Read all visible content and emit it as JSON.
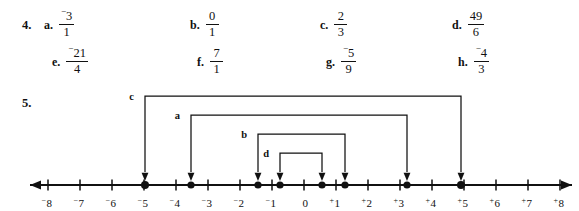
{
  "exercise4": {
    "number": "4.",
    "items": [
      {
        "letter": "a.",
        "numerator": "3",
        "numerator_sign": "−",
        "denominator": "1",
        "x": 44,
        "y": 10
      },
      {
        "letter": "b.",
        "numerator": "0",
        "numerator_sign": "",
        "denominator": "1",
        "x": 190,
        "y": 10
      },
      {
        "letter": "c.",
        "numerator": "2",
        "numerator_sign": "",
        "denominator": "3",
        "x": 320,
        "y": 10
      },
      {
        "letter": "d.",
        "numerator": "49",
        "numerator_sign": "",
        "denominator": "6",
        "x": 452,
        "y": 10
      },
      {
        "letter": "e.",
        "numerator": "21",
        "numerator_sign": "−",
        "denominator": "4",
        "x": 52,
        "y": 47
      },
      {
        "letter": "f.",
        "numerator": "7",
        "numerator_sign": "",
        "denominator": "1",
        "x": 197,
        "y": 47
      },
      {
        "letter": "g.",
        "numerator": "5",
        "numerator_sign": "−",
        "denominator": "9",
        "x": 326,
        "y": 47
      },
      {
        "letter": "h.",
        "numerator": "4",
        "numerator_sign": "−",
        "denominator": "3",
        "x": 458,
        "y": 47
      }
    ]
  },
  "exercise5": {
    "number": "5.",
    "number_line": {
      "axis_y": 101,
      "origin_x": 304,
      "unit_px": 32,
      "x_start": 30,
      "x_end": 572,
      "left_arrowhead": true,
      "right_arrowhead": true,
      "tick_height": 11,
      "ticks": [
        {
          "value": -8,
          "sign": "−",
          "label": "8"
        },
        {
          "value": -7,
          "sign": "−",
          "label": "7"
        },
        {
          "value": -6,
          "sign": "−",
          "label": "6"
        },
        {
          "value": -5,
          "sign": "−",
          "label": "5"
        },
        {
          "value": -4,
          "sign": "−",
          "label": "4"
        },
        {
          "value": -3,
          "sign": "−",
          "label": "3"
        },
        {
          "value": -2,
          "sign": "−",
          "label": "2"
        },
        {
          "value": -1,
          "sign": "−",
          "label": "1"
        },
        {
          "value": 0,
          "sign": "",
          "label": "0"
        },
        {
          "value": 1,
          "sign": "+",
          "label": "1"
        },
        {
          "value": 2,
          "sign": "+",
          "label": "2"
        },
        {
          "value": 3,
          "sign": "+",
          "label": "3"
        },
        {
          "value": 4,
          "sign": "+",
          "label": "4"
        },
        {
          "value": 5,
          "sign": "+",
          "label": "5"
        },
        {
          "value": 6,
          "sign": "+",
          "label": "6"
        },
        {
          "value": 7,
          "sign": "+",
          "label": "7"
        },
        {
          "value": 8,
          "sign": "+",
          "label": "8"
        }
      ],
      "points": [
        {
          "x_px": 145,
          "radius": 4.0
        },
        {
          "x_px": 191,
          "radius": 3.6
        },
        {
          "x_px": 258,
          "radius": 3.6
        },
        {
          "x_px": 280,
          "radius": 3.6
        },
        {
          "x_px": 322,
          "radius": 3.6
        },
        {
          "x_px": 345,
          "radius": 3.6
        },
        {
          "x_px": 407,
          "radius": 3.6
        },
        {
          "x_px": 461,
          "radius": 4.0
        }
      ],
      "arcs": [
        {
          "label": "c",
          "top_y": 12,
          "left_x": 145,
          "right_x": 461,
          "label_x": 134,
          "label_y": 16
        },
        {
          "label": "a",
          "top_y": 31,
          "left_x": 191,
          "right_x": 407,
          "label_x": 180,
          "label_y": 35
        },
        {
          "label": "b",
          "top_y": 50,
          "left_x": 258,
          "right_x": 345,
          "label_x": 247,
          "label_y": 54
        },
        {
          "label": "d",
          "top_y": 69,
          "left_x": 280,
          "right_x": 322,
          "label_x": 269,
          "label_y": 73
        }
      ]
    }
  },
  "colors": {
    "ink": "#111111",
    "paper": "#ffffff"
  }
}
